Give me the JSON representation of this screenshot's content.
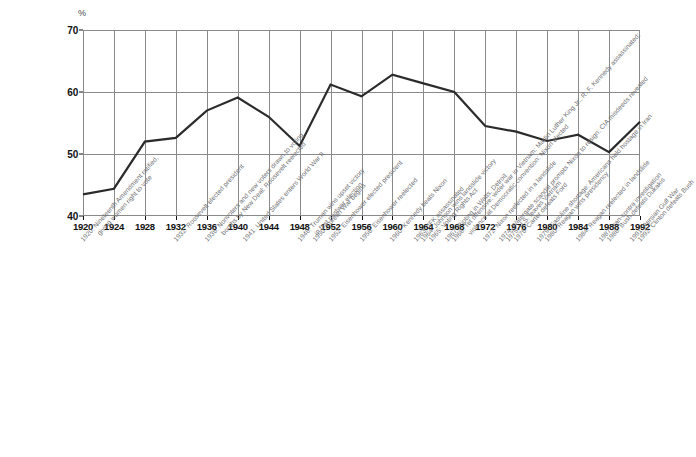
{
  "chart_data": {
    "type": "line",
    "title": "",
    "subtitle": "",
    "xlabel": "",
    "ylabel": "%",
    "ylim": [
      40,
      70
    ],
    "xlim": [
      1920,
      1992
    ],
    "grid": true,
    "legend": "none",
    "ytick_labels": [
      "40",
      "50",
      "60",
      "70"
    ],
    "ytick_values": [
      40,
      50,
      60,
      70
    ],
    "categories": [
      1920,
      1924,
      1928,
      1932,
      1936,
      1940,
      1944,
      1948,
      1952,
      1956,
      1960,
      1964,
      1968,
      1972,
      1976,
      1980,
      1984,
      1988,
      1992
    ],
    "xtick_labels": [
      "1920",
      "1924",
      "1928",
      "1932",
      "1936",
      "1940",
      "1944",
      "1948",
      "1952",
      "1956",
      "1960",
      "1964",
      "1968",
      "1972",
      "1976",
      "1980",
      "1984",
      "1988",
      "1992"
    ],
    "values": [
      43.5,
      44.4,
      52.0,
      52.6,
      57.0,
      59.1,
      56.0,
      51.3,
      61.2,
      59.3,
      62.8,
      61.4,
      60.0,
      54.5,
      53.6,
      52.1,
      53.1,
      50.3,
      55.2
    ],
    "series": [
      {
        "name": "Voter turnout",
        "values": [
          43.5,
          44.4,
          52.0,
          52.6,
          57.0,
          59.1,
          56.0,
          51.3,
          61.2,
          59.3,
          62.8,
          61.4,
          60.0,
          54.5,
          53.6,
          52.1,
          53.1,
          50.3,
          55.2
        ]
      }
    ],
    "line_color": "#2b2b2b",
    "grid_color": "#8a8a8a",
    "annotations": [
      {
        "year": 1920,
        "lines": [
          "1920: Nineteenth Amendment ratified,",
          "giving women right to vote"
        ]
      },
      {
        "year": 1932,
        "lines": [
          "1932: Roosevelt elected president"
        ]
      },
      {
        "year": 1936,
        "lines": [
          "1936: Nonvoters and new voters drawn to voting",
          "booths by New Deal; Roosevelt reelected"
        ]
      },
      {
        "year": 1941,
        "lines": [
          "1941: United States enters World War II"
        ]
      },
      {
        "year": 1948,
        "lines": [
          "1948: Truman wins upset victory",
          "in first postwar election"
        ]
      },
      {
        "year": 1950,
        "lines": [
          "1950: Korean War begins"
        ]
      },
      {
        "year": 1952,
        "lines": [
          "1952: Eisenhower elected president"
        ]
      },
      {
        "year": 1956,
        "lines": [
          "1956: Eisenhower reelected"
        ]
      },
      {
        "year": 1960,
        "lines": [
          "1960: Kennedy beats Nixon"
        ]
      },
      {
        "year": 1963,
        "lines": [
          "1963: JFK assassinated"
        ]
      },
      {
        "year": 1964,
        "lines": [
          "1964: Johnson wins landslide victory"
        ]
      },
      {
        "year": 1965,
        "lines": [
          "1965: Voting Rights Act"
        ]
      },
      {
        "year": 1967,
        "lines": [
          "1967: Rioting in Watts, Detroit"
        ]
      },
      {
        "year": 1968,
        "lines": [
          "1968: Tet offensive; wider war in Vietnam; Martin Luther King Jr., R. F. Kennedy assassinated;",
          "violence at Democratic convention; Nixon elected"
        ]
      },
      {
        "year": 1972,
        "lines": [
          "1972: Nixon reelected in a landslide"
        ]
      },
      {
        "year": 1974,
        "lines": [
          "1974: Watergate scandal prompts Nixon to resign; CIA misdeeds revealed"
        ]
      },
      {
        "year": 1975,
        "lines": [
          "1975: U.S. leaves Vietnam"
        ]
      },
      {
        "year": 1976,
        "lines": [
          "1976: Carter defeats Ford"
        ]
      },
      {
        "year": 1979,
        "lines": [
          "1979: Gasoline shortage; Americans held hostage in Iran"
        ]
      },
      {
        "year": 1980,
        "lines": [
          "1980: Reagan wins presidency"
        ]
      },
      {
        "year": 1984,
        "lines": [
          "1984: Reagan reelected in landslide"
        ]
      },
      {
        "year": 1987,
        "lines": [
          "1987: Iran-contra investigation"
        ]
      },
      {
        "year": 1988,
        "lines": [
          "1988: Bush defeats Dukakis"
        ]
      },
      {
        "year": 1991,
        "lines": [
          "1991: Persian Gulf War"
        ]
      },
      {
        "year": 1992,
        "lines": [
          "1992: Clinton defeats Bush"
        ]
      }
    ]
  }
}
